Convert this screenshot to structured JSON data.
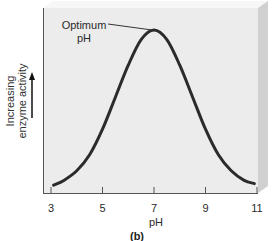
{
  "chart_data": {
    "type": "line",
    "title": "",
    "panel_label": "(b)",
    "xlabel": "pH",
    "ylabel": "Increasing enzyme activity",
    "ylabel_lines": [
      "Increasing",
      "enzyme activity"
    ],
    "x_ticks": [
      3,
      5,
      7,
      9,
      11
    ],
    "xlim": [
      3,
      11
    ],
    "y_ticks": [],
    "grid": false,
    "legend": null,
    "annotations": [
      {
        "text_lines": [
          "Optimum",
          "pH"
        ],
        "points_to": {
          "x": 7,
          "y": 1.0
        }
      }
    ],
    "series": [
      {
        "name": "Enzyme activity",
        "color": "#2b2b2b",
        "x": [
          3.1,
          3.5,
          4,
          4.5,
          5,
          5.5,
          6,
          6.5,
          7,
          7.5,
          8,
          8.5,
          9,
          9.5,
          10,
          10.5,
          10.9
        ],
        "y": [
          0.03,
          0.06,
          0.12,
          0.22,
          0.38,
          0.58,
          0.78,
          0.94,
          1.0,
          0.94,
          0.78,
          0.58,
          0.38,
          0.22,
          0.12,
          0.06,
          0.04
        ]
      }
    ]
  },
  "colors": {
    "panel_face": "#ececec",
    "panel_top": "#f6f6f6",
    "panel_side": "#cfcfcf",
    "axis": "#555555",
    "curve": "#2b2b2b",
    "text": "#2a2a2a"
  },
  "icons": {
    "y_axis_arrow": "arrow-up-icon"
  }
}
